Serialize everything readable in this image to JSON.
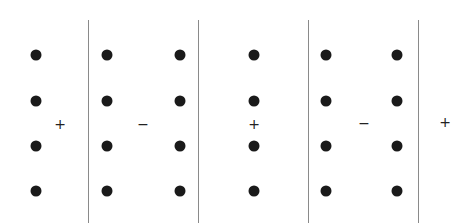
{
  "diagram": {
    "row_y": [
      55,
      101,
      146,
      191
    ],
    "dot_columns_x": [
      36,
      107,
      180,
      254,
      326,
      397
    ],
    "line_x": [
      88,
      198,
      308,
      418
    ],
    "signs": [
      {
        "text": "+",
        "x": 60,
        "y": 124
      },
      {
        "text": "−",
        "x": 143,
        "y": 124
      },
      {
        "text": "+",
        "x": 254,
        "y": 124
      },
      {
        "text": "−",
        "x": 364,
        "y": 123
      },
      {
        "text": "+",
        "x": 445,
        "y": 122
      }
    ]
  }
}
